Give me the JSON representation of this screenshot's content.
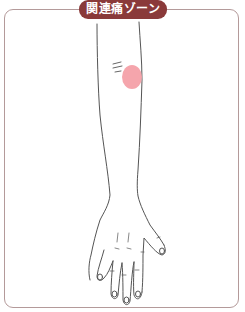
{
  "title": "関連痛ゾーン",
  "figure": {
    "highlight": {
      "label": "referred pain zone",
      "location": "lateral elbow / upper forearm",
      "color": "#f4a0a8"
    }
  },
  "colors": {
    "frame_border": "#b49a9a",
    "title_background": "#8a3a3a",
    "title_text": "#ffffff",
    "outline": "#555555"
  }
}
